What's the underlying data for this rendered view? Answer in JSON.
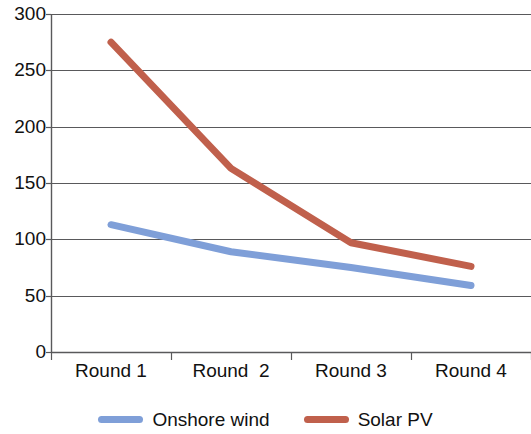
{
  "chart_data": {
    "type": "line",
    "title": "",
    "subtitle": "",
    "xlabel": "",
    "ylabel": "",
    "categories": [
      "Round 1",
      "Round  2",
      "Round 3",
      "Round 4"
    ],
    "series": [
      {
        "name": "Onshore wind",
        "color": "#7F9FD8",
        "values": [
          113,
          89,
          75,
          59
        ]
      },
      {
        "name": "Solar PV",
        "color": "#C0604C",
        "values": [
          275,
          163,
          97,
          76
        ]
      }
    ],
    "ylim": [
      0,
      300
    ],
    "ytick_step": 50,
    "ytick_labels": [
      "300",
      "250",
      "200",
      "150",
      "100",
      "50",
      "0"
    ],
    "grid": "horizontal",
    "legend_position": "bottom",
    "markers": false,
    "line_width": 7
  },
  "legend": {
    "entries": [
      {
        "label": "Onshore wind",
        "color": "#7F9FD8"
      },
      {
        "label": "Solar PV",
        "color": "#C0604C"
      }
    ]
  },
  "axes": {
    "y_ticks": [
      "300",
      "250",
      "200",
      "150",
      "100",
      "50",
      "0"
    ],
    "x_ticks": [
      "Round 1",
      "Round  2",
      "Round 3",
      "Round 4"
    ]
  },
  "colors": {
    "series_blue": "#7F9FD8",
    "series_red": "#C0604C",
    "axis": "#59595b",
    "grid": "#59595b",
    "text": "#111111",
    "background": "#ffffff"
  }
}
